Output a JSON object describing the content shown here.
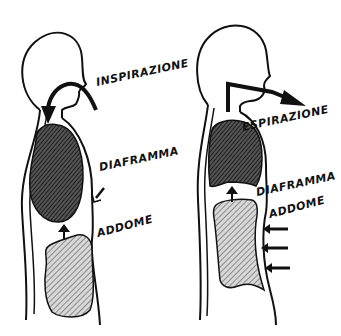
{
  "diagram": {
    "type": "breathing-mechanism-illustration",
    "colors": {
      "outline": "#111111",
      "lung_fill": "#444444",
      "abdomen_fill": "#9a9a9a",
      "background": "#ffffff"
    },
    "figures": [
      {
        "id": "inspiration",
        "labels": {
          "action": "INSPIRAZIONE",
          "diaphragm": "DIAFRAMMA",
          "abdomen": "ADDOME"
        }
      },
      {
        "id": "expiration",
        "labels": {
          "action": "ESPIRAZIONE",
          "diaphragm": "DIAFRAMMA",
          "abdomen": "ADDOME"
        }
      }
    ]
  }
}
